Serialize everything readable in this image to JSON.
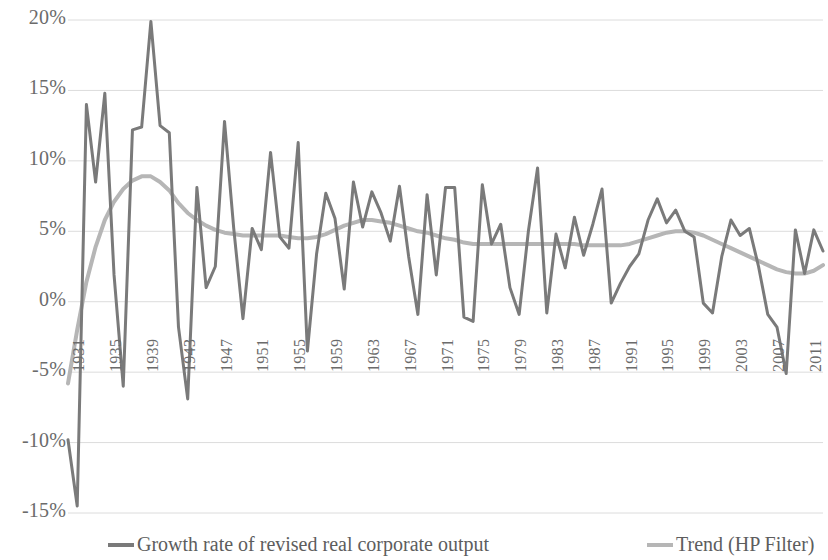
{
  "chart_data": {
    "type": "line",
    "title": "",
    "subtitle": "",
    "xlabel": "",
    "ylabel": "",
    "grid": true,
    "legend_position": "bottom",
    "ylim": [
      -15,
      20
    ],
    "ytick_labels": [
      "20%",
      "15%",
      "10%",
      "5%",
      "0%",
      "-5%",
      "-10%",
      "-15%"
    ],
    "ytick_values": [
      20,
      15,
      10,
      5,
      0,
      -5,
      -10,
      -15
    ],
    "xlim": [
      1930,
      2012
    ],
    "xtick_labels": [
      "1931",
      "1935",
      "1939",
      "1943",
      "1947",
      "1951",
      "1955",
      "1959",
      "1963",
      "1967",
      "1971",
      "1975",
      "1979",
      "1983",
      "1987",
      "1991",
      "1995",
      "1999",
      "2003",
      "2007",
      "2011"
    ],
    "xtick_values": [
      1931,
      1935,
      1939,
      1943,
      1947,
      1951,
      1955,
      1959,
      1963,
      1967,
      1971,
      1975,
      1979,
      1983,
      1987,
      1991,
      1995,
      1999,
      2003,
      2007,
      2011
    ],
    "x": [
      1930,
      1931,
      1932,
      1933,
      1934,
      1935,
      1936,
      1937,
      1938,
      1939,
      1940,
      1941,
      1942,
      1943,
      1944,
      1945,
      1946,
      1947,
      1948,
      1949,
      1950,
      1951,
      1952,
      1953,
      1954,
      1955,
      1956,
      1957,
      1958,
      1959,
      1960,
      1961,
      1962,
      1963,
      1964,
      1965,
      1966,
      1967,
      1968,
      1969,
      1970,
      1971,
      1972,
      1973,
      1974,
      1975,
      1976,
      1977,
      1978,
      1979,
      1980,
      1981,
      1982,
      1983,
      1984,
      1985,
      1986,
      1987,
      1988,
      1989,
      1990,
      1991,
      1992,
      1993,
      1994,
      1995,
      1996,
      1997,
      1998,
      1999,
      2000,
      2001,
      2002,
      2003,
      2004,
      2005,
      2006,
      2007,
      2008,
      2009,
      2010,
      2011,
      2012
    ],
    "series": [
      {
        "name": "Growth rate of revised real corporate output",
        "color": "#7a7a7a",
        "width": 3.0,
        "values": [
          -9.8,
          -14.5,
          14.0,
          8.5,
          14.8,
          1.9,
          -6.0,
          12.2,
          12.4,
          19.9,
          12.5,
          12.0,
          -1.8,
          -6.9,
          8.1,
          1.0,
          2.5,
          12.8,
          5.2,
          -1.2,
          5.2,
          3.7,
          10.6,
          4.6,
          3.8,
          11.3,
          -3.5,
          3.4,
          7.7,
          5.9,
          0.9,
          8.5,
          5.3,
          7.8,
          6.3,
          4.3,
          8.2,
          3.2,
          -0.9,
          7.6,
          1.9,
          8.1,
          8.1,
          -1.1,
          -1.4,
          8.3,
          4.1,
          5.5,
          1.0,
          -0.9,
          5.0,
          9.5,
          -0.8,
          4.8,
          2.4,
          6.0,
          3.3,
          5.5,
          8.0,
          -0.1,
          1.3,
          2.5,
          3.4,
          5.8,
          7.3,
          5.6,
          6.5,
          5.0,
          4.6,
          -0.1,
          -0.8,
          3.2,
          5.8,
          4.7,
          5.2,
          2.5,
          -0.9,
          -1.8,
          -5.1,
          5.1,
          2.0,
          5.1,
          3.6
        ]
      },
      {
        "name": "Trend (HP Filter)",
        "color": "#b6b6b6",
        "width": 4.0,
        "values": [
          -5.8,
          -2.0,
          1.4,
          3.9,
          5.8,
          7.1,
          8.0,
          8.6,
          8.9,
          8.9,
          8.5,
          7.9,
          7.0,
          6.3,
          5.8,
          5.4,
          5.1,
          4.9,
          4.8,
          4.7,
          4.7,
          4.7,
          4.7,
          4.7,
          4.6,
          4.5,
          4.5,
          4.6,
          4.8,
          5.1,
          5.4,
          5.6,
          5.8,
          5.8,
          5.7,
          5.6,
          5.4,
          5.2,
          5.0,
          4.9,
          4.7,
          4.5,
          4.4,
          4.2,
          4.1,
          4.1,
          4.1,
          4.1,
          4.1,
          4.1,
          4.1,
          4.1,
          4.1,
          4.1,
          4.1,
          4.1,
          4.0,
          4.0,
          4.0,
          4.0,
          4.0,
          4.1,
          4.3,
          4.5,
          4.7,
          4.9,
          5.0,
          5.0,
          4.9,
          4.7,
          4.4,
          4.1,
          3.8,
          3.5,
          3.2,
          2.9,
          2.6,
          2.3,
          2.1,
          2.0,
          2.0,
          2.2,
          2.6
        ]
      }
    ],
    "legend": [
      {
        "label": "Growth rate of revised real corporate output",
        "color": "#7a7a7a"
      },
      {
        "label": "Trend (HP Filter)",
        "color": "#b6b6b6"
      }
    ]
  },
  "colors": {
    "series_main": "#7a7a7a",
    "series_trend": "#b6b6b6",
    "grid": "#dcdcdc",
    "text": "#6b6b6b",
    "background": "#ffffff"
  }
}
